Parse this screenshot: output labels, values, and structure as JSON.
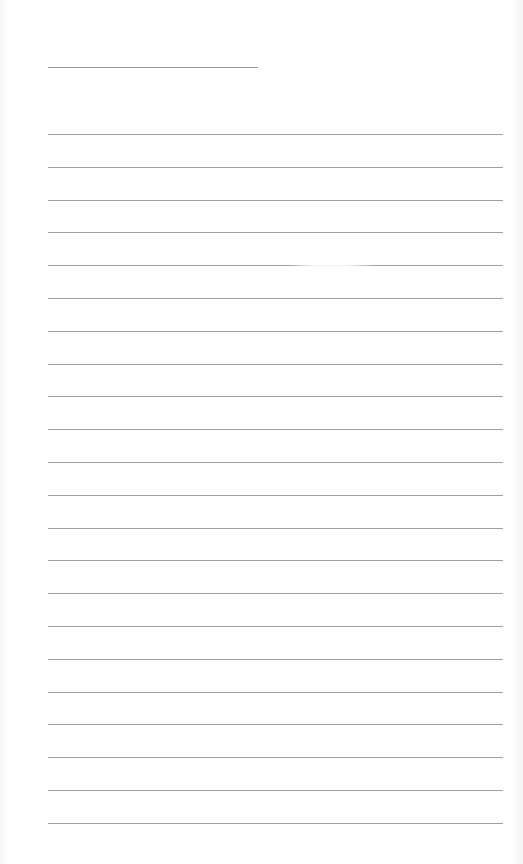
{
  "page": {
    "type": "ruled-sheet",
    "title_line": {
      "present": true
    },
    "rules": {
      "count": 22,
      "first_top": 134,
      "spacing": 32.8
    },
    "colors": {
      "paper": "#ffffff",
      "rule": "#a0a0a0"
    }
  }
}
